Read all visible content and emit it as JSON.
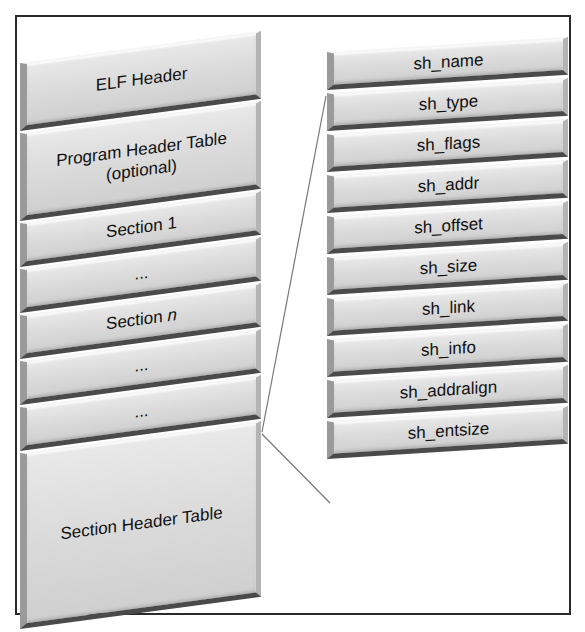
{
  "diagram": {
    "left_stack": {
      "blocks": [
        {
          "label": "ELF Header",
          "height": 68
        },
        {
          "label": "Program Header Table",
          "label2": "(optional)",
          "height": 88
        },
        {
          "label": "Section 1",
          "height": 44
        },
        {
          "label": "...",
          "height": 44
        },
        {
          "label": "Section ",
          "italic_suffix": "n",
          "height": 44
        },
        {
          "label": "...",
          "height": 44
        },
        {
          "label": "...",
          "height": 44
        },
        {
          "label": "Section Header Table",
          "height": 176
        }
      ]
    },
    "right_stack": {
      "blocks": [
        {
          "label": "sh_name"
        },
        {
          "label": "sh_type"
        },
        {
          "label": "sh_flags"
        },
        {
          "label": "sh_addr"
        },
        {
          "label": "sh_offset"
        },
        {
          "label": "sh_size"
        },
        {
          "label": "sh_link"
        },
        {
          "label": "sh_info"
        },
        {
          "label": "sh_addralign"
        },
        {
          "label": "sh_entsize"
        }
      ]
    },
    "connectors": [
      {
        "from": "section-header-table",
        "to": "sh_name",
        "description": "expansion line (top)"
      },
      {
        "from": "section-header-table",
        "to": "sh_entsize",
        "description": "expansion line (bottom)"
      }
    ],
    "colors": {
      "block_fill": "#dcdcdc",
      "block_shadow": "#4a4a4a",
      "frame": "#2a2a2a",
      "connector": "#777777",
      "text": "#111111"
    }
  }
}
